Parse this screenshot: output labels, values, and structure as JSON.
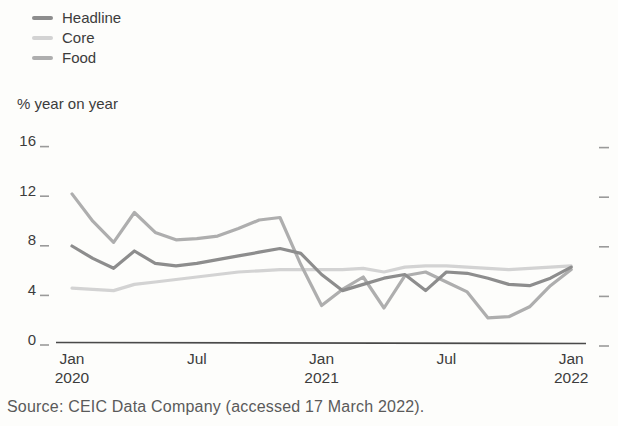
{
  "figure": {
    "axis_unit_label": "% year on year",
    "source": "Source: CEIC Data Company (accessed 17 March 2022)."
  },
  "chart_data": {
    "type": "line",
    "title": "",
    "xlabel": "",
    "ylabel": "% year on year",
    "ylim": [
      0,
      16
    ],
    "yticks": [
      0,
      4,
      8,
      12,
      16
    ],
    "grid": false,
    "legend_position": "top-left",
    "x": [
      "2020-01",
      "2020-02",
      "2020-03",
      "2020-04",
      "2020-05",
      "2020-06",
      "2020-07",
      "2020-08",
      "2020-09",
      "2020-10",
      "2020-11",
      "2020-12",
      "2021-01",
      "2021-02",
      "2021-03",
      "2021-04",
      "2021-05",
      "2021-06",
      "2021-07",
      "2021-08",
      "2021-09",
      "2021-10",
      "2021-11",
      "2021-12",
      "2022-01"
    ],
    "xticks": [
      {
        "index": 0,
        "line1": "Jan",
        "line2": "2020"
      },
      {
        "index": 6,
        "line1": "Jul",
        "line2": ""
      },
      {
        "index": 12,
        "line1": "Jan",
        "line2": "2021"
      },
      {
        "index": 18,
        "line1": "Jul",
        "line2": ""
      },
      {
        "index": 24,
        "line1": "Jan",
        "line2": "2022"
      }
    ],
    "series": [
      {
        "name": "Headline",
        "color": "#8d8d8d",
        "values": [
          7.5,
          6.5,
          5.7,
          7.1,
          6.1,
          5.9,
          6.1,
          6.4,
          6.7,
          7.0,
          7.3,
          6.9,
          5.2,
          3.9,
          4.4,
          4.9,
          5.2,
          3.9,
          5.4,
          5.3,
          4.9,
          4.4,
          4.3,
          4.9,
          5.8
        ]
      },
      {
        "name": "Core",
        "color": "#d3d3d3",
        "values": [
          4.1,
          4.0,
          3.9,
          4.4,
          4.6,
          4.8,
          5.0,
          5.2,
          5.4,
          5.5,
          5.6,
          5.6,
          5.6,
          5.6,
          5.7,
          5.4,
          5.8,
          5.9,
          5.9,
          5.8,
          5.7,
          5.6,
          5.7,
          5.8,
          5.9
        ]
      },
      {
        "name": "Food",
        "color": "#aeaeae",
        "values": [
          11.7,
          9.5,
          7.8,
          10.2,
          8.6,
          8.0,
          8.1,
          8.3,
          8.9,
          9.6,
          9.8,
          6.0,
          2.7,
          4.0,
          5.0,
          2.5,
          5.1,
          5.4,
          4.6,
          3.8,
          1.7,
          1.8,
          2.6,
          4.3,
          5.6
        ]
      }
    ]
  }
}
